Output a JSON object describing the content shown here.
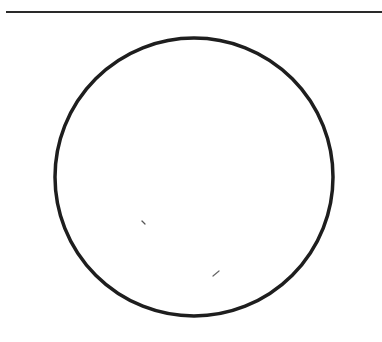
{
  "page": {
    "width": 382,
    "height": 342,
    "background": "#ffffff"
  },
  "diagram": {
    "rule": {
      "x1": 6,
      "y1": 12,
      "x2": 382,
      "y2": 12,
      "stroke": "#2a2a2a",
      "stroke_width": 2
    },
    "circle": {
      "cx": 194,
      "cy": 177,
      "r": 139,
      "stroke": "#1e1e1e",
      "stroke_width": 3.5,
      "fill": "none"
    },
    "marks": [
      {
        "x1": 142,
        "y1": 221,
        "x2": 145,
        "y2": 224,
        "stroke": "#555555",
        "stroke_width": 1.2
      },
      {
        "x1": 213,
        "y1": 276,
        "x2": 219,
        "y2": 271,
        "stroke": "#666666",
        "stroke_width": 1.2
      }
    ]
  }
}
